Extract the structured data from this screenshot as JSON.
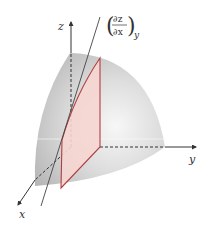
{
  "figure": {
    "axes": {
      "x_label": "x",
      "y_label": "y",
      "z_label": "z"
    },
    "annotation": {
      "derivative_numerator": "∂z",
      "derivative_denominator": "∂x",
      "subscript": "y",
      "meaning": "partial derivative of z with respect to x at constant y"
    },
    "colors": {
      "surface": "#c8c8c8",
      "surface_highlight": "#f4f4f4",
      "plane_fill": "#f6d6d2",
      "plane_edge": "#b04040",
      "axis": "#333333",
      "tangent_line": "#444444"
    }
  }
}
